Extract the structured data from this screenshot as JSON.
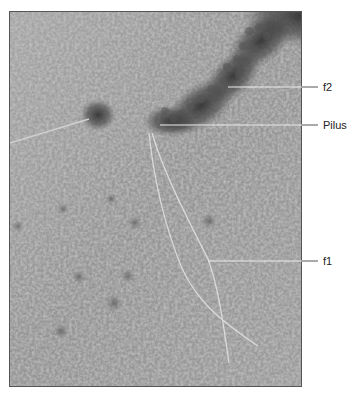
{
  "figure": {
    "type": "electron-micrograph",
    "labels": [
      {
        "id": "f2",
        "text": "f2",
        "x": 323,
        "y": 88,
        "pointer_from": [
          228,
          87
        ],
        "pointer_to": [
          318,
          87
        ]
      },
      {
        "id": "pilus",
        "text": "Pilus",
        "x": 323,
        "y": 126,
        "pointer_from": [
          160,
          125
        ],
        "pointer_to": [
          318,
          125
        ]
      },
      {
        "id": "f1",
        "text": "f1",
        "x": 323,
        "y": 262,
        "pointer_from": [
          208,
          261
        ],
        "pointer_to": [
          318,
          261
        ]
      }
    ],
    "colors": {
      "background": "#9a9a9a",
      "dark_aggregate": "#3a3a3a",
      "filament": "#d8d8d8",
      "leader_line": "#e8e8e8",
      "label_text": "#222222"
    }
  }
}
